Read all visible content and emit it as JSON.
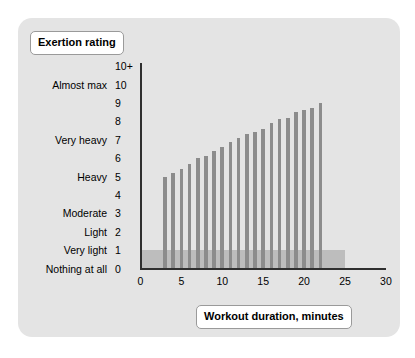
{
  "card": {
    "background": "#e4e4e4",
    "border_radius": 14
  },
  "y_axis_title": "Exertion rating",
  "x_axis_title": "Workout duration, minutes",
  "colors": {
    "bar": "#8c8c8c",
    "band": "#bdbdbd",
    "axis": "#2f2f2f",
    "card_bg": "#e4e4e4",
    "pill_bg": "#ffffff",
    "pill_border": "#9a9a9a",
    "text": "#000000"
  },
  "y_ticks": [
    {
      "value": "10+",
      "label": ""
    },
    {
      "value": "10",
      "label": "Almost max"
    },
    {
      "value": "9",
      "label": ""
    },
    {
      "value": "8",
      "label": ""
    },
    {
      "value": "7",
      "label": "Very heavy"
    },
    {
      "value": "6",
      "label": ""
    },
    {
      "value": "5",
      "label": "Heavy"
    },
    {
      "value": "4",
      "label": ""
    },
    {
      "value": "3",
      "label": "Moderate"
    },
    {
      "value": "2",
      "label": "Light"
    },
    {
      "value": "1",
      "label": "Very light"
    },
    {
      "value": "0",
      "label": "Nothing at all"
    }
  ],
  "x_ticks": [
    "0",
    "5",
    "10",
    "15",
    "20",
    "25",
    "30"
  ],
  "chart_data": {
    "type": "bar",
    "title": "",
    "xlabel": "Workout duration, minutes",
    "ylabel": "Exertion rating",
    "xlim": [
      0,
      30
    ],
    "ylim": [
      0,
      11
    ],
    "grid": false,
    "legend": false,
    "y_tick_values": [
      0,
      1,
      2,
      3,
      4,
      5,
      6,
      7,
      8,
      9,
      10,
      11
    ],
    "y_tick_labels": [
      "0",
      "1",
      "2",
      "3",
      "4",
      "5",
      "6",
      "7",
      "8",
      "9",
      "10",
      "10+"
    ],
    "y_category_labels": {
      "0": "Nothing at all",
      "1": "Very light",
      "2": "Light",
      "3": "Moderate",
      "5": "Heavy",
      "7": "Very heavy",
      "10": "Almost max"
    },
    "x_tick_values": [
      0,
      5,
      10,
      15,
      20,
      25,
      30
    ],
    "x": [
      3.0,
      4.0,
      5.0,
      6.0,
      7.0,
      8.0,
      9.0,
      10.0,
      11.0,
      12.0,
      13.0,
      14.0,
      15.0,
      16.0,
      17.0,
      18.0,
      19.0,
      20.0,
      21.0,
      22.0
    ],
    "values": [
      5.0,
      5.2,
      5.4,
      5.7,
      6.0,
      6.1,
      6.4,
      6.6,
      6.9,
      7.1,
      7.3,
      7.4,
      7.6,
      7.9,
      8.1,
      8.2,
      8.5,
      8.6,
      8.7,
      9.0
    ],
    "bar_width_minutes": 0.45,
    "bands": [
      {
        "name": "warm-up-cool-down-band",
        "x_start": 0,
        "x_end": 25,
        "y_start": 0,
        "y_end": 1,
        "color": "#bdbdbd"
      }
    ]
  }
}
